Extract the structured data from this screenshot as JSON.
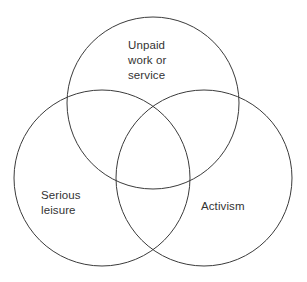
{
  "diagram": {
    "type": "venn",
    "title": "",
    "background_color": "#ffffff",
    "stroke_color": "#3b3b3b",
    "text_color": "#333333",
    "sets": [
      {
        "id": "unpaid-work-or-service",
        "label": "Unpaid\nwork or\nservice",
        "position": "top",
        "center_x": 153,
        "center_y": 103,
        "radius": 86
      },
      {
        "id": "serious-leisure",
        "label": "Serious\nleisure",
        "position": "bottom-left",
        "center_x": 102,
        "center_y": 178,
        "radius": 88
      },
      {
        "id": "activism",
        "label": "Activism",
        "position": "bottom-right",
        "center_x": 204,
        "center_y": 178,
        "radius": 88
      }
    ]
  }
}
